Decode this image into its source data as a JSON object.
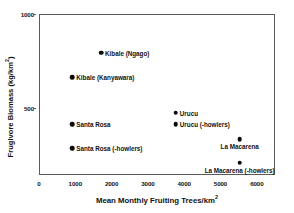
{
  "chart_data": {
    "type": "scatter",
    "title": "",
    "xlabel": "Mean Monthly Fruiting Trees/km²",
    "ylabel": "Frugivore Biomass (kg/km²)",
    "xlabel_base": "Mean Monthly Fruiting Trees/km",
    "xlabel_sup": "2",
    "ylabel_base": "Frugivore Biomass (kg/km",
    "ylabel_sup": "2",
    "ylabel_tail": ")",
    "xlim": [
      0,
      6500
    ],
    "ylim": [
      0,
      1000
    ],
    "xticks": [
      0,
      1000,
      2000,
      3000,
      4000,
      5000,
      6000
    ],
    "xticklabels": [
      "0",
      "1000",
      "2000",
      "3000",
      "4000",
      "5000",
      "6000"
    ],
    "yticks": [
      500,
      1000
    ],
    "yticklabels": [
      "500",
      "1000"
    ],
    "grid": false,
    "legend": "none (points labeled directly)",
    "marker": "filled-circle",
    "marker_color": "#0b0b0b",
    "points": [
      {
        "label": "Kibale (Ngago)",
        "x": 1680,
        "y": 800,
        "label_pos": "right"
      },
      {
        "label": "Kibale (Kanyawara)",
        "x": 890,
        "y": 670,
        "label_pos": "right"
      },
      {
        "label": "Santa Rosa",
        "x": 890,
        "y": 420,
        "label_pos": "right"
      },
      {
        "label": "Santa Rosa (-howlers)",
        "x": 890,
        "y": 290,
        "label_pos": "right"
      },
      {
        "label": "Urucu",
        "x": 3740,
        "y": 480,
        "label_pos": "right"
      },
      {
        "label": "Urucu (-howlers)",
        "x": 3740,
        "y": 420,
        "label_pos": "right"
      },
      {
        "label": "La Macarena",
        "x": 5500,
        "y": 340,
        "label_pos": "below"
      },
      {
        "label": "La Macarena (-howlers)",
        "x": 5500,
        "y": 215,
        "label_pos": "below"
      }
    ]
  }
}
